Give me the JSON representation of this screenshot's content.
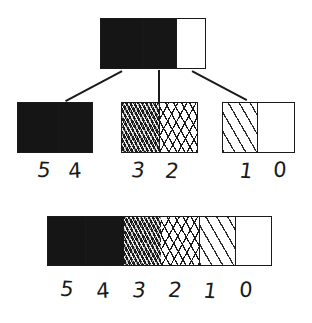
{
  "diagram": {
    "levels": [
      {
        "id": "5",
        "label": "5",
        "fill": "solid-black",
        "class": "lv5"
      },
      {
        "id": "4",
        "label": "4",
        "fill": "dense-stipple",
        "class": "lv4"
      },
      {
        "id": "3",
        "label": "3",
        "fill": "dense-crosshatch",
        "class": "lv3"
      },
      {
        "id": "2",
        "label": "2",
        "fill": "medium-crosshatch",
        "class": "lv2"
      },
      {
        "id": "1",
        "label": "1",
        "fill": "sparse-diagonal",
        "class": "lv1"
      },
      {
        "id": "0",
        "label": "0",
        "fill": "white",
        "class": "lv0"
      }
    ],
    "colors": {
      "ink": "#1a1a1a",
      "paper": "#ffffff"
    }
  },
  "root_box": {
    "name": "root-bar",
    "segments": [
      {
        "label": "5",
        "class": "lv5",
        "width_pct": 40
      },
      {
        "label": "4",
        "class": "lv4",
        "width_pct": 33
      },
      {
        "label": "0",
        "class": "lv0",
        "width_pct": 27
      }
    ]
  },
  "children": [
    {
      "name": "child-bar-left",
      "segments": [
        {
          "label": "5",
          "class": "lv5",
          "width_pct": 55
        },
        {
          "label": "4",
          "class": "lv4",
          "width_pct": 45
        }
      ],
      "labels": [
        "5",
        "4"
      ]
    },
    {
      "name": "child-bar-middle",
      "segments": [
        {
          "label": "3",
          "class": "lv3",
          "width_pct": 50
        },
        {
          "label": "2",
          "class": "lv2",
          "width_pct": 50
        }
      ],
      "labels": [
        "3",
        "2"
      ]
    },
    {
      "name": "child-bar-right",
      "segments": [
        {
          "label": "1",
          "class": "lv1",
          "width_pct": 48
        },
        {
          "label": "0",
          "class": "lv0",
          "width_pct": 52
        }
      ],
      "labels": [
        "1",
        "0"
      ]
    }
  ],
  "scale_bar": {
    "name": "full-scale-bar",
    "segments": [
      {
        "label": "5",
        "class": "lv5",
        "width_pct": 17
      },
      {
        "label": "4",
        "class": "lv4",
        "width_pct": 17
      },
      {
        "label": "3",
        "class": "lv3",
        "width_pct": 17
      },
      {
        "label": "2",
        "class": "lv2",
        "width_pct": 17
      },
      {
        "label": "1",
        "class": "lv1",
        "width_pct": 16
      },
      {
        "label": "0",
        "class": "lv0",
        "width_pct": 16
      }
    ],
    "labels": [
      "5",
      "4",
      "3",
      "2",
      "1",
      "0"
    ]
  }
}
